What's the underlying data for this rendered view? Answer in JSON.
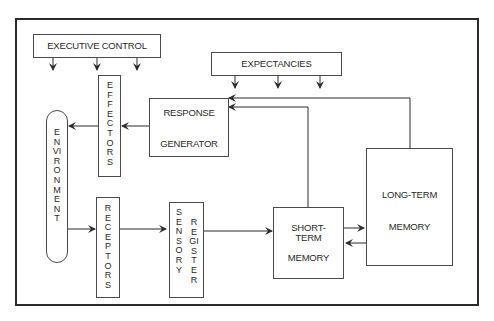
{
  "diagram": {
    "type": "information-processing flow diagram",
    "nodes": {
      "executive_control": "EXECUTIVE CONTROL",
      "expectancies": "EXPECTANCIES",
      "effectors": "EFFECTORS",
      "environment": "ENVIRONMENT",
      "response_generator_line1": "RESPONSE",
      "response_generator_line2": "GENERATOR",
      "receptors": "RECEPTORS",
      "sensory_line1": "SENSORY",
      "sensory_line2": "REGISTER",
      "short_term_line1": "SHORT-",
      "short_term_line2": "TERM",
      "short_term_line3": "MEMORY",
      "long_term_line1": "LONG-TERM",
      "long_term_line2": "MEMORY"
    },
    "edges": [
      {
        "from": "Environment",
        "to": "Receptors"
      },
      {
        "from": "Receptors",
        "to": "Sensory Register"
      },
      {
        "from": "Sensory Register",
        "to": "Short-Term Memory"
      },
      {
        "from": "Short-Term Memory",
        "to": "Long-Term Memory"
      },
      {
        "from": "Long-Term Memory",
        "to": "Short-Term Memory"
      },
      {
        "from": "Short-Term Memory",
        "to": "Response Generator"
      },
      {
        "from": "Long-Term Memory",
        "to": "Response Generator"
      },
      {
        "from": "Response Generator",
        "to": "Effectors"
      },
      {
        "from": "Effectors",
        "to": "Environment"
      },
      {
        "from": "Executive Control",
        "to": "(downward, 3 arrows)"
      },
      {
        "from": "Expectancies",
        "to": "(downward, 3 arrows)"
      }
    ],
    "colors": {
      "line": "#2b2b2b",
      "background": "#ffffff"
    }
  }
}
